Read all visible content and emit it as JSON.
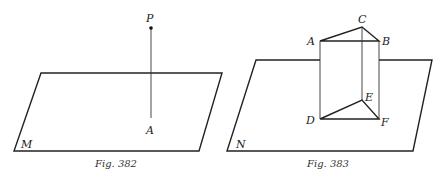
{
  "figures": [
    {
      "caption": "Fig. 382",
      "plane_label": "M",
      "points": {
        "P": "P",
        "A": "A"
      }
    },
    {
      "caption": "Fig. 383",
      "plane_label": "N",
      "points": {
        "A": "A",
        "B": "B",
        "C": "C",
        "D": "D",
        "E": "E",
        "F": "F"
      }
    }
  ],
  "colors": {
    "line": "#222222",
    "background": "#ffffff"
  }
}
